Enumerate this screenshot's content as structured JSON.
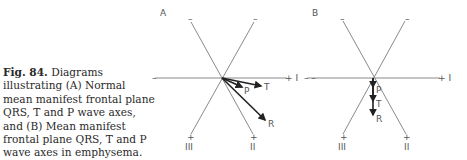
{
  "caption": {
    "figure_label": "Fig. 84.",
    "text": "Diagrams illustrating (A) Normal mean manifest frontal plane QRS, T and P wave axes, and (B) Mean manifest frontal plane QRS, T and P wave axes in emphysema."
  },
  "panels": [
    {
      "id": "A",
      "label": "A",
      "lead_labels": {
        "I_pos": "+ I",
        "I_neg": "–",
        "II": "II",
        "III": "III",
        "II_pos": "+",
        "III_pos": "+",
        "II_neg": "–",
        "III_neg": "–"
      },
      "vectors": [
        {
          "name": "T",
          "label": "T"
        },
        {
          "name": "P",
          "label": "P"
        },
        {
          "name": "R",
          "label": "R"
        }
      ]
    },
    {
      "id": "B",
      "label": "B",
      "lead_labels": {
        "I_pos": "+ I",
        "I_neg": "– –",
        "II": "II",
        "III": "III",
        "II_pos": "+",
        "III_pos": "+",
        "II_neg": "–",
        "III_neg": "–"
      },
      "vectors": [
        {
          "name": "P",
          "label": "P"
        },
        {
          "name": "T",
          "label": "T"
        },
        {
          "name": "R",
          "label": "R"
        }
      ]
    }
  ]
}
